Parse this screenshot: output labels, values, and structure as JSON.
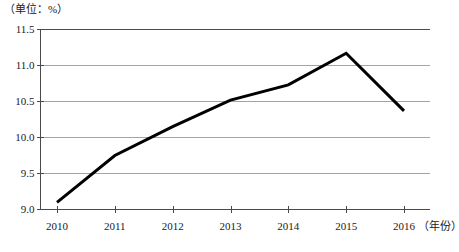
{
  "chart_data": {
    "type": "line",
    "title": "",
    "unit_label": "（单位：%）",
    "xlabel": "（年份）",
    "ylabel": "",
    "categories": [
      "2010",
      "2011",
      "2012",
      "2013",
      "2014",
      "2015",
      "2016"
    ],
    "values": [
      9.1,
      9.75,
      10.15,
      10.52,
      10.73,
      11.17,
      10.37
    ],
    "series": [
      {
        "name": "比例",
        "values": [
          9.1,
          9.75,
          10.15,
          10.52,
          10.73,
          11.17,
          10.37
        ]
      }
    ],
    "ylim": [
      9.0,
      11.5
    ],
    "y_ticks": [
      "9.0",
      "9.5",
      "10.0",
      "10.5",
      "11.0",
      "11.5"
    ],
    "y_tick_values": [
      9.0,
      9.5,
      10.0,
      10.5,
      11.0,
      11.5
    ],
    "grid": true,
    "grid_color": "#9a9a9a",
    "legend": false,
    "legend_position": "none",
    "line_color": "#000000",
    "line_width": 3,
    "markers": false,
    "axis_color": "#4a4a4a",
    "background_color": "#ffffff"
  }
}
